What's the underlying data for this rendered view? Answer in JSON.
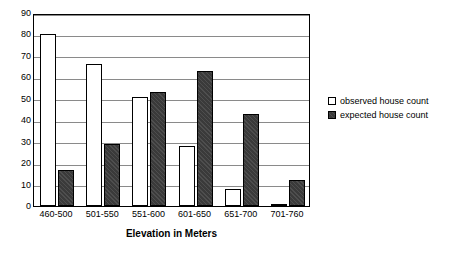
{
  "chart_data": {
    "type": "bar",
    "title": "",
    "xlabel": "Elevation in Meters",
    "ylabel": "",
    "categories": [
      "460-500",
      "501-550",
      "551-600",
      "601-650",
      "651-700",
      "701-760"
    ],
    "series": [
      {
        "name": "observed house count",
        "values": [
          80,
          66,
          51,
          28,
          8,
          1
        ],
        "color": "#ffffff"
      },
      {
        "name": "expected house count",
        "values": [
          17,
          29,
          53,
          63,
          43,
          12
        ],
        "color": "#3a3a3a"
      }
    ],
    "ylim": [
      0,
      90
    ],
    "yticks": [
      0,
      10,
      20,
      30,
      40,
      50,
      60,
      70,
      80,
      90
    ],
    "ytick_labels": [
      "0",
      "10",
      "20",
      "30",
      "40",
      "50",
      "60",
      "70",
      "80",
      "90"
    ],
    "grid": "horizontal",
    "legend_position": "right"
  },
  "legend": {
    "items": [
      {
        "label": "observed house count"
      },
      {
        "label": "expected house count"
      }
    ]
  }
}
